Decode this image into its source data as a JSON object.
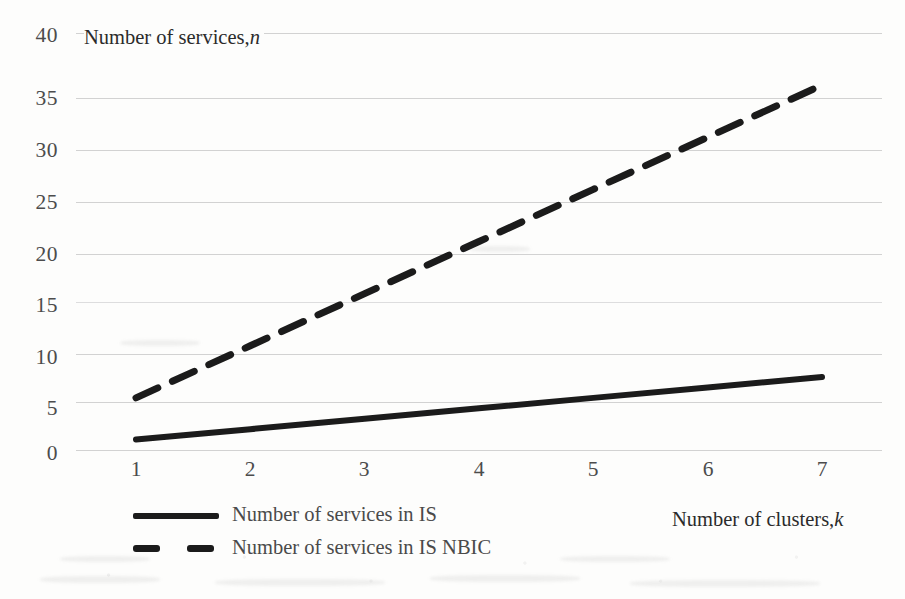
{
  "chart_data": {
    "type": "line",
    "title": "",
    "ylabel": "Number of services, n",
    "ylabel_plain": "Number of services,",
    "ylabel_italic": "n",
    "xlabel": "Number of clusters, k",
    "xlabel_plain": "Number of clusters,",
    "xlabel_italic": "k",
    "x": [
      1,
      2,
      3,
      4,
      5,
      6,
      7
    ],
    "xticklabels": [
      "1",
      "2",
      "3",
      "4",
      "5",
      "6",
      "7"
    ],
    "yticklabels": [
      "0",
      "5",
      "10",
      "15",
      "20",
      "25",
      "30",
      "35",
      "40"
    ],
    "yticks": [
      0,
      5,
      10,
      15,
      20,
      25,
      30,
      35,
      40
    ],
    "xlim": [
      1,
      7
    ],
    "ylim": [
      0,
      40
    ],
    "grid": "horizontal",
    "grid_color": "#96969a",
    "legend_position": "bottom-left",
    "series": [
      {
        "name": "Number of services in IS",
        "style": "solid",
        "color": "#1b1b1b",
        "values": [
          1,
          2,
          3,
          4,
          5,
          6,
          7
        ]
      },
      {
        "name": "Number of services in IS NBIC",
        "style": "dashed",
        "color": "#1b1b1b",
        "values": [
          5,
          10,
          15,
          20,
          25,
          30,
          35
        ]
      }
    ]
  },
  "legend": {
    "items": [
      {
        "label": "Number of services in IS",
        "style": "solid"
      },
      {
        "label": "Number of services in IS NBIC",
        "style": "dashed"
      }
    ]
  }
}
